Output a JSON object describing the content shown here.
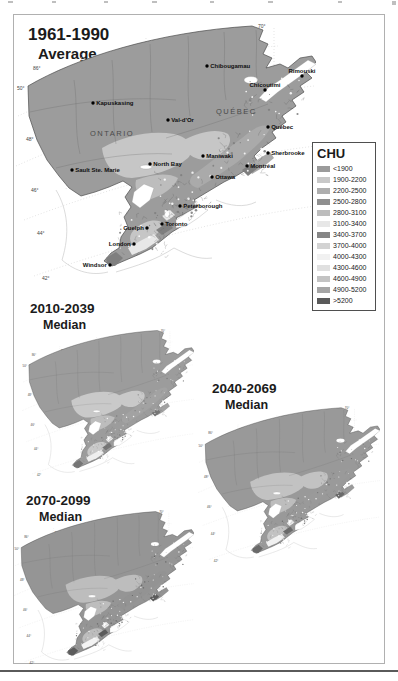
{
  "figure": {
    "panels": [
      {
        "title_line1": "1961-1990",
        "title_line2": "Average"
      },
      {
        "title_line1": "2010-2039",
        "title_line2": "Median"
      },
      {
        "title_line1": "2040-2069",
        "title_line2": "Median"
      },
      {
        "title_line1": "2070-2099",
        "title_line2": "Median"
      }
    ]
  },
  "legend": {
    "title": "CHU",
    "items": [
      {
        "label": "<1900",
        "color": "#9b9b9b"
      },
      {
        "label": "1900-2200",
        "color": "#c8c8c8"
      },
      {
        "label": "2200-2500",
        "color": "#aeaeae"
      },
      {
        "label": "2500-2800",
        "color": "#8f8f8f"
      },
      {
        "label": "2800-3100",
        "color": "#bdbdbd"
      },
      {
        "label": "3100-3400",
        "color": "#e7e7e7"
      },
      {
        "label": "3400-3700",
        "color": "#868686"
      },
      {
        "label": "3700-4000",
        "color": "#d3d3d3"
      },
      {
        "label": "4000-4300",
        "color": "#f1f1f1"
      },
      {
        "label": "4300-4600",
        "color": "#e0e0e0"
      },
      {
        "label": "4600-4900",
        "color": "#c3c3c3"
      },
      {
        "label": "4900-5200",
        "color": "#a5a5a5"
      },
      {
        "label": ">5200",
        "color": "#5a5a5a"
      }
    ]
  },
  "big_map": {
    "provinces": [
      {
        "text": "ONTARIO",
        "x": 74,
        "y": 116
      },
      {
        "text": "QUÉBEC",
        "x": 200,
        "y": 94
      }
    ],
    "cities": [
      {
        "name": "Chibougamau",
        "x": 191,
        "y": 46,
        "side": "right"
      },
      {
        "name": "Rimouski",
        "x": 286,
        "y": 56,
        "side": "above"
      },
      {
        "name": "Chicoutimi",
        "x": 249,
        "y": 70,
        "side": "above"
      },
      {
        "name": "Kapuskasing",
        "x": 77,
        "y": 83,
        "side": "right"
      },
      {
        "name": "Val-d'Or",
        "x": 152,
        "y": 100,
        "side": "right"
      },
      {
        "name": "Québec",
        "x": 252,
        "y": 107,
        "side": "right"
      },
      {
        "name": "Maniwaki",
        "x": 187,
        "y": 136,
        "side": "right"
      },
      {
        "name": "Sherbrooke",
        "x": 252,
        "y": 133,
        "side": "right"
      },
      {
        "name": "Montréal",
        "x": 231,
        "y": 146,
        "side": "right"
      },
      {
        "name": "North Bay",
        "x": 134,
        "y": 144,
        "side": "right"
      },
      {
        "name": "Sault Ste. Marie",
        "x": 56,
        "y": 150,
        "side": "right"
      },
      {
        "name": "Ottawa",
        "x": 196,
        "y": 157,
        "side": "right"
      },
      {
        "name": "Peterborough",
        "x": 164,
        "y": 186,
        "side": "right"
      },
      {
        "name": "Toronto",
        "x": 146,
        "y": 204,
        "side": "right"
      },
      {
        "name": "Guelph",
        "x": 131,
        "y": 208,
        "side": "left"
      },
      {
        "name": "London",
        "x": 118,
        "y": 224,
        "side": "left"
      },
      {
        "name": "Windsor",
        "x": 94,
        "y": 245,
        "side": "left"
      }
    ]
  },
  "graticule": {
    "longitude": [
      "86°",
      "82°",
      "78°",
      "74°",
      "70°"
    ],
    "latitude": [
      "50°",
      "48°",
      "46°",
      "44°",
      "42°"
    ]
  }
}
